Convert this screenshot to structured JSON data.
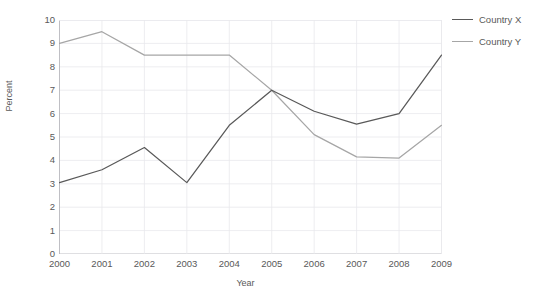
{
  "chart_data": {
    "type": "line",
    "title": "",
    "xlabel": "Year",
    "ylabel": "Percent",
    "categories": [
      "2000",
      "2001",
      "2002",
      "2003",
      "2004",
      "2005",
      "2006",
      "2007",
      "2008",
      "2009"
    ],
    "x": [
      2000,
      2001,
      2002,
      2003,
      2004,
      2005,
      2006,
      2007,
      2008,
      2009
    ],
    "series": [
      {
        "name": "Country X",
        "color": "#595959",
        "values": [
          3.05,
          3.6,
          4.55,
          3.05,
          5.5,
          7.0,
          6.1,
          5.55,
          6.0,
          8.5
        ]
      },
      {
        "name": "Country Y",
        "color": "#a6a6a6",
        "values": [
          9.0,
          9.5,
          8.5,
          8.5,
          8.5,
          7.0,
          5.1,
          4.15,
          4.1,
          5.5
        ]
      }
    ],
    "ylim": [
      0,
      10
    ],
    "yticks": [
      "0",
      "1",
      "2",
      "3",
      "4",
      "5",
      "6",
      "7",
      "8",
      "9",
      "10"
    ],
    "ytick_values": [
      0,
      1,
      2,
      3,
      4,
      5,
      6,
      7,
      8,
      9,
      10
    ],
    "grid": true,
    "grid_color": "#e8e8ec",
    "legend_position": "right",
    "markers": false
  },
  "axis": {
    "y_title": "Percent",
    "x_title": "Year"
  },
  "legend": {
    "entries": [
      {
        "label": "Country X",
        "color": "#595959"
      },
      {
        "label": "Country Y",
        "color": "#a6a6a6"
      }
    ]
  }
}
